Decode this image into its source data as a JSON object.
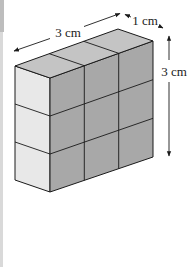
{
  "figure": {
    "dimensions": {
      "length_label": "3 cm",
      "depth_label": "1 cm",
      "height_label": "3 cm"
    },
    "grid": {
      "columns": 3,
      "rows": 3,
      "depth": 1
    },
    "colors": {
      "top_face": "#c4c4c4",
      "side_face": "#e8e8e8",
      "front_face": "#a8a8a8",
      "edge": "#1a1a1a"
    }
  }
}
